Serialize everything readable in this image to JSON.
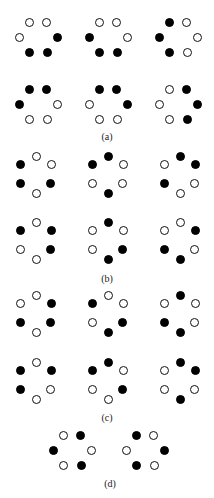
{
  "figure": {
    "layouts": {
      "horizontal": {
        "TL": [
          -9,
          -15
        ],
        "TR": [
          8,
          -15
        ],
        "L": [
          -19,
          0
        ],
        "R": [
          19,
          0
        ],
        "BL": [
          -9,
          15
        ],
        "BR": [
          9,
          15
        ]
      },
      "vertical": {
        "T": [
          0,
          -18
        ],
        "UL": [
          -16,
          -10
        ],
        "UR": [
          15,
          -10
        ],
        "LL": [
          -16,
          9
        ],
        "LR": [
          14,
          9
        ],
        "B": [
          0,
          19
        ]
      }
    },
    "groups": [
      {
        "label": "(a)",
        "label_pos": [
          107,
          131
        ],
        "layout": "horizontal",
        "patterns": [
          {
            "center": [
              38,
              37
            ],
            "states": {
              "TL": "open",
              "TR": "open",
              "L": "open",
              "R": "filled",
              "BL": "filled",
              "BR": "filled"
            }
          },
          {
            "center": [
              108,
              37
            ],
            "states": {
              "TL": "open",
              "TR": "open",
              "L": "filled",
              "R": "open",
              "BL": "filled",
              "BR": "filled"
            }
          },
          {
            "center": [
              178,
              37
            ],
            "states": {
              "TL": "filled",
              "TR": "open",
              "L": "filled",
              "R": "open",
              "BL": "filled",
              "BR": "open"
            }
          },
          {
            "center": [
              38,
              104
            ],
            "states": {
              "TL": "filled",
              "TR": "filled",
              "L": "filled",
              "R": "open",
              "BL": "open",
              "BR": "open"
            }
          },
          {
            "center": [
              108,
              104
            ],
            "states": {
              "TL": "filled",
              "TR": "filled",
              "L": "open",
              "R": "filled",
              "BL": "open",
              "BR": "open"
            }
          },
          {
            "center": [
              178,
              104
            ],
            "states": {
              "TL": "open",
              "TR": "filled",
              "L": "open",
              "R": "filled",
              "BL": "open",
              "BR": "filled"
            }
          }
        ]
      },
      {
        "label": "(b)",
        "label_pos": [
          107,
          273
        ],
        "layout": "vertical",
        "patterns": [
          {
            "center": [
              36,
              174
            ],
            "states": {
              "T": "open",
              "UL": "filled",
              "UR": "open",
              "LL": "filled",
              "LR": "filled",
              "B": "open"
            }
          },
          {
            "center": [
              108,
              174
            ],
            "states": {
              "T": "filled",
              "UL": "filled",
              "UR": "open",
              "LL": "open",
              "LR": "open",
              "B": "filled"
            }
          },
          {
            "center": [
              180,
              174
            ],
            "states": {
              "T": "filled",
              "UL": "open",
              "UR": "filled",
              "LL": "filled",
              "LR": "open",
              "B": "open"
            }
          },
          {
            "center": [
              36,
              240
            ],
            "states": {
              "T": "open",
              "UL": "filled",
              "UR": "filled",
              "LL": "open",
              "LR": "filled",
              "B": "open"
            }
          },
          {
            "center": [
              108,
              240
            ],
            "states": {
              "T": "filled",
              "UL": "open",
              "UR": "open",
              "LL": "open",
              "LR": "filled",
              "B": "filled"
            }
          },
          {
            "center": [
              180,
              240
            ],
            "states": {
              "T": "open",
              "UL": "open",
              "UR": "filled",
              "LL": "filled",
              "LR": "open",
              "B": "filled"
            }
          }
        ]
      },
      {
        "label": "(c)",
        "label_pos": [
          107,
          412
        ],
        "layout": "vertical",
        "patterns": [
          {
            "center": [
              36,
              313
            ],
            "states": {
              "T": "open",
              "UL": "open",
              "UR": "filled",
              "LL": "filled",
              "LR": "filled",
              "B": "open"
            }
          },
          {
            "center": [
              108,
              313
            ],
            "states": {
              "T": "open",
              "UL": "filled",
              "UR": "open",
              "LL": "open",
              "LR": "filled",
              "B": "filled"
            }
          },
          {
            "center": [
              180,
              313
            ],
            "states": {
              "T": "filled",
              "UL": "open",
              "UR": "open",
              "LL": "filled",
              "LR": "open",
              "B": "filled"
            }
          },
          {
            "center": [
              36,
              380
            ],
            "states": {
              "T": "open",
              "UL": "filled",
              "UR": "filled",
              "LL": "filled",
              "LR": "open",
              "B": "open"
            }
          },
          {
            "center": [
              108,
              380
            ],
            "states": {
              "T": "filled",
              "UL": "filled",
              "UR": "open",
              "LL": "open",
              "LR": "filled",
              "B": "open"
            }
          },
          {
            "center": [
              180,
              380
            ],
            "states": {
              "T": "filled",
              "UL": "open",
              "UR": "filled",
              "LL": "open",
              "LR": "open",
              "B": "filled"
            }
          }
        ]
      },
      {
        "label": "(d)",
        "label_pos": [
          110,
          478
        ],
        "layout": "horizontal",
        "patterns": [
          {
            "center": [
              72,
              450
            ],
            "states": {
              "TL": "open",
              "TR": "filled",
              "L": "filled",
              "R": "open",
              "BL": "open",
              "BR": "filled"
            }
          },
          {
            "center": [
              145,
              450
            ],
            "states": {
              "TL": "filled",
              "TR": "open",
              "L": "open",
              "R": "filled",
              "BL": "filled",
              "BR": "open"
            }
          }
        ]
      }
    ]
  }
}
